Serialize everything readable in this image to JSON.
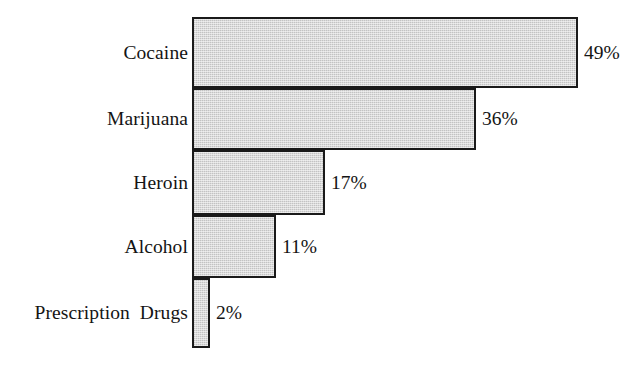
{
  "chart_data": {
    "type": "bar",
    "orientation": "horizontal",
    "title": "",
    "subtitle": "",
    "xlabel": "",
    "ylabel": "",
    "xlim": [
      0,
      49
    ],
    "grid": false,
    "legend": null,
    "value_suffix": "%",
    "categories": [
      "Cocaine",
      "Marijuana",
      "Heroin",
      "Alcohol",
      "Prescription  Drugs"
    ],
    "values": [
      49,
      36,
      17,
      11,
      2
    ],
    "value_labels": [
      "49%",
      "36%",
      "17%",
      "11%",
      "2%"
    ],
    "colors": {
      "bar_fill": "#cdcdcd",
      "bar_border": "#1a1a1a",
      "text": "#141414",
      "background": "#ffffff"
    },
    "bars": [
      {
        "label": "Cocaine",
        "value": 49,
        "value_label": "49%",
        "top": 17,
        "height": 71,
        "width": 386
      },
      {
        "label": "Marijuana",
        "value": 36,
        "value_label": "36%",
        "top": 88,
        "height": 62,
        "width": 284
      },
      {
        "label": "Heroin",
        "value": 17,
        "value_label": "17%",
        "top": 150,
        "height": 65,
        "width": 133
      },
      {
        "label": "Alcohol",
        "value": 11,
        "value_label": "11%",
        "top": 215,
        "height": 63,
        "width": 84
      },
      {
        "label": "Prescription  Drugs",
        "value": 2,
        "value_label": "2%",
        "top": 278,
        "height": 70,
        "width": 18
      }
    ]
  }
}
